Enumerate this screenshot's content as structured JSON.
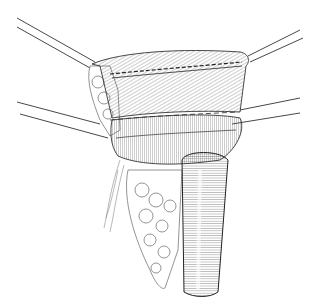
{
  "illustration": {
    "subject": "surgical line drawing of retracted tissue with tubular structure",
    "style": "black ink hatched line art on white",
    "background": "#ffffff",
    "ink": "#2a2a2a",
    "retraction_sutures": 4
  }
}
